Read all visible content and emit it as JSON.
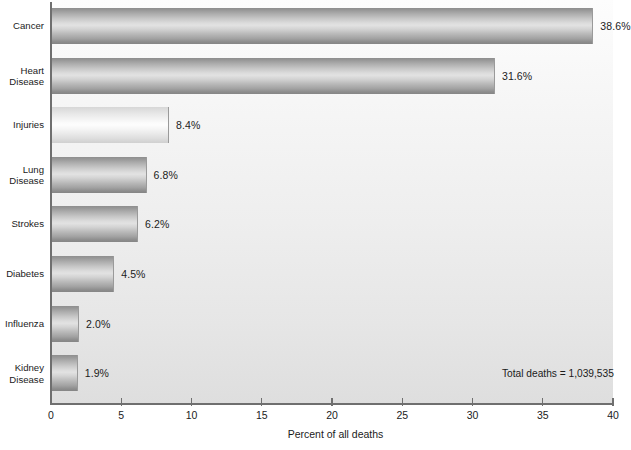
{
  "chart_data": {
    "type": "bar",
    "orientation": "horizontal",
    "title": "",
    "xlabel": "Percent of all deaths",
    "ylabel": "",
    "xlim": [
      0,
      40
    ],
    "xticks": [
      0,
      5,
      10,
      15,
      20,
      25,
      30,
      35,
      40
    ],
    "xtick_labels": [
      "0",
      "5",
      "10",
      "15",
      "20",
      "25",
      "30",
      "35",
      "40"
    ],
    "grid": false,
    "legend": false,
    "categories": [
      "Cancer",
      "Heart\nDisease",
      "Injuries",
      "Lung\nDisease",
      "Strokes",
      "Diabetes",
      "Influenza",
      "Kidney\nDisease"
    ],
    "values": [
      38.6,
      31.6,
      8.4,
      6.8,
      6.2,
      4.5,
      2.0,
      1.9
    ],
    "value_labels": [
      "38.6%",
      "31.6%",
      "8.4%",
      "6.8%",
      "6.2%",
      "4.5%",
      "2.0%",
      "1.9%"
    ],
    "bar_styles": [
      "dark",
      "dark",
      "light",
      "dark",
      "dark",
      "dark",
      "dark",
      "dark"
    ],
    "annotations": [
      {
        "text": "Total deaths = 1,039,535"
      }
    ]
  },
  "colors": {
    "bar_dark_mid": "#e2e2e2",
    "bar_dark_edge": "#878787",
    "bar_light_mid": "#fdfdfd",
    "bar_light_edge": "#d0d0d0",
    "axis": "#6f6f6f",
    "text": "#1b1b1b",
    "plot_background_top": "#fdfdfd",
    "plot_background_bottom": "#dedede"
  }
}
